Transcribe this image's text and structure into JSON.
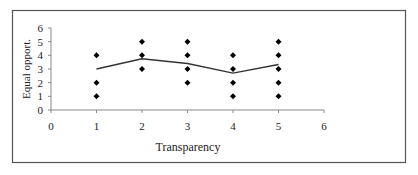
{
  "chart_data": {
    "type": "scatter",
    "title": "",
    "xlabel": "Transparency",
    "ylabel": "Equal opport.",
    "xlim": [
      0,
      6
    ],
    "ylim": [
      0,
      6
    ],
    "x_ticks": [
      0,
      1,
      2,
      3,
      4,
      5,
      6
    ],
    "y_ticks": [
      0,
      1,
      2,
      3,
      4,
      5,
      6
    ],
    "grid": false,
    "legend": null,
    "series": [
      {
        "name": "observations",
        "kind": "scatter",
        "marker": "diamond",
        "points": [
          [
            1,
            4
          ],
          [
            1,
            2
          ],
          [
            1,
            1
          ],
          [
            2,
            5
          ],
          [
            2,
            4
          ],
          [
            2,
            3
          ],
          [
            3,
            5
          ],
          [
            3,
            4
          ],
          [
            3,
            3
          ],
          [
            3,
            2
          ],
          [
            4,
            4
          ],
          [
            4,
            3
          ],
          [
            4,
            2
          ],
          [
            4,
            1
          ],
          [
            5,
            5
          ],
          [
            5,
            4
          ],
          [
            5,
            3
          ],
          [
            5,
            2
          ],
          [
            5,
            1
          ]
        ]
      },
      {
        "name": "mean",
        "kind": "line",
        "x": [
          1,
          2,
          3,
          4,
          5
        ],
        "values": [
          3.0,
          3.75,
          3.4,
          2.7,
          3.33
        ]
      }
    ]
  },
  "colors": {
    "frame": "#555555",
    "axis": "#888888",
    "marker": "#000000",
    "line": "#333333"
  }
}
